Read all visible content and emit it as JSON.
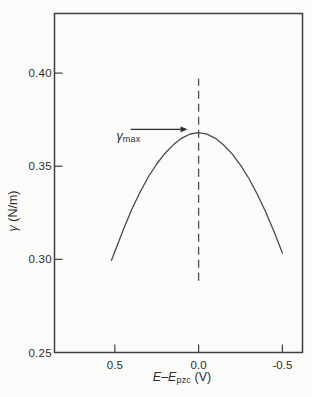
{
  "figure": {
    "background": "#fbfbf9"
  },
  "chart_data": {
    "type": "line",
    "title": "",
    "xlabel": {
      "pre": "E–E",
      "sub": "pzc",
      "post": " (V)"
    },
    "ylabel": {
      "sym": "γ",
      "rest": " (N/m)"
    },
    "xlim": [
      0.86,
      -0.62
    ],
    "ylim": [
      0.25,
      0.432
    ],
    "x_axis_reversed": true,
    "grid": false,
    "legend": "none",
    "x_ticks": [
      {
        "v": 0.5,
        "label": "0.5"
      },
      {
        "v": 0.0,
        "label": "0.0"
      },
      {
        "v": -0.5,
        "label": "-0.5"
      }
    ],
    "y_ticks": [
      {
        "v": 0.4,
        "label": "0.40",
        "tick": true
      },
      {
        "v": 0.35,
        "label": "0.35",
        "tick": true
      },
      {
        "v": 0.3,
        "label": "0.30",
        "tick": true
      },
      {
        "v": 0.25,
        "label": "0.25",
        "tick": false
      }
    ],
    "series": [
      {
        "name": "electrocapillary-curve",
        "points": [
          [
            0.52,
            0.2995
          ],
          [
            0.45,
            0.3157
          ],
          [
            0.4,
            0.3266
          ],
          [
            0.35,
            0.336
          ],
          [
            0.3,
            0.3442
          ],
          [
            0.25,
            0.3512
          ],
          [
            0.2,
            0.357
          ],
          [
            0.15,
            0.3616
          ],
          [
            0.1,
            0.3651
          ],
          [
            0.05,
            0.3673
          ],
          [
            0.0,
            0.368
          ],
          [
            -0.05,
            0.3672
          ],
          [
            -0.1,
            0.365
          ],
          [
            -0.15,
            0.3614
          ],
          [
            -0.2,
            0.3566
          ],
          [
            -0.25,
            0.3506
          ],
          [
            -0.3,
            0.3434
          ],
          [
            -0.35,
            0.335
          ],
          [
            -0.4,
            0.3256
          ],
          [
            -0.45,
            0.315
          ],
          [
            -0.5,
            0.3034
          ]
        ]
      }
    ],
    "annotations": {
      "gamma_max": {
        "sym": "γ",
        "sub": "max",
        "label_x": 0.49,
        "label_y": 0.3645,
        "arrow": {
          "x1": 0.405,
          "x2": 0.066,
          "y": 0.3698
        }
      },
      "dashed_line": {
        "x": 0.0,
        "y1": 0.2885,
        "y2": 0.397
      }
    },
    "colors": {
      "axis": "#3f3f3f",
      "curve": "#4a4a4a",
      "dashed": "#4f4f4f",
      "text": "#2e2e2e"
    }
  }
}
